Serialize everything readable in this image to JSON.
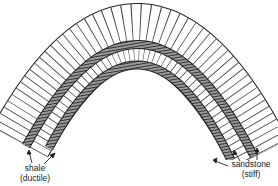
{
  "diagram": {
    "type": "anticline fold cross-section",
    "layers": [
      {
        "name": "sandstone",
        "property": "stiff",
        "position": "outer"
      },
      {
        "name": "shale",
        "property": "ductile",
        "position": "upper-middle"
      },
      {
        "name": "sandstone",
        "property": "stiff",
        "position": "middle"
      },
      {
        "name": "shale",
        "property": "ductile",
        "position": "lower-middle"
      },
      {
        "name": "sandstone",
        "property": "stiff",
        "position": "inner"
      }
    ],
    "labels": {
      "shale": {
        "name": "shale",
        "property": "(ductile)"
      },
      "sandstone": {
        "name": "sandstone",
        "property": "(stiff)"
      }
    },
    "colors": {
      "line": "#222222",
      "shale_fill": "#3a3a3a",
      "sandstone_fill": "#ffffff",
      "background": "#ffffff"
    }
  }
}
